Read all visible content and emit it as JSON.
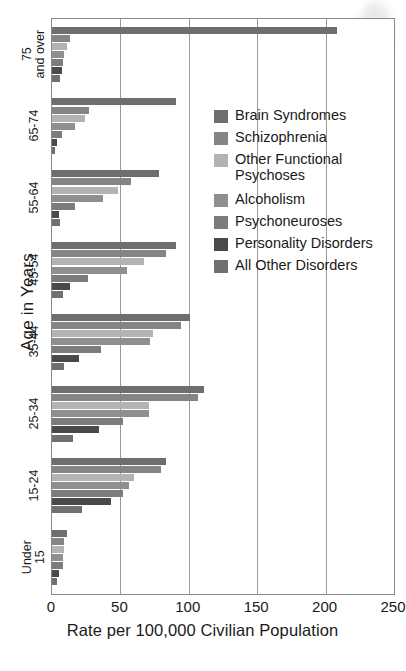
{
  "chart_data": {
    "type": "bar",
    "orientation": "horizontal",
    "title": "",
    "xlabel": "Rate per 100,000 Civilian Population",
    "ylabel": "Age in Years",
    "xlim": [
      0,
      250
    ],
    "xticks": [
      0,
      50,
      100,
      150,
      200,
      250
    ],
    "grid": "vertical",
    "legend_position": "inside-right",
    "categories": [
      "75 and over",
      "65-74",
      "55-64",
      "45-54",
      "35-44",
      "25-34",
      "15-24",
      "Under 15"
    ],
    "series": [
      {
        "name": "Brain Syndromes",
        "color": "#6e6e6e",
        "values": [
          208,
          91,
          78,
          91,
          101,
          111,
          83,
          11
        ]
      },
      {
        "name": "Schizophrenia",
        "color": "#858585",
        "values": [
          13,
          27,
          58,
          83,
          94,
          107,
          80,
          9
        ]
      },
      {
        "name": "Other Functional Psychoses",
        "color": "#b3b3b3",
        "values": [
          11,
          24,
          48,
          67,
          74,
          71,
          60,
          9
        ]
      },
      {
        "name": "Alcoholism",
        "color": "#8f8f8f",
        "values": [
          9,
          17,
          37,
          55,
          72,
          71,
          56,
          8
        ]
      },
      {
        "name": "Psychoneuroses",
        "color": "#7c7c7c",
        "values": [
          8,
          7,
          17,
          26,
          36,
          52,
          52,
          8
        ]
      },
      {
        "name": "Personality Disorders",
        "color": "#4a4a4a",
        "values": [
          7,
          4,
          5,
          13,
          20,
          34,
          43,
          5
        ]
      },
      {
        "name": "All Other Disorders",
        "color": "#707070",
        "values": [
          6,
          2,
          6,
          8,
          9,
          15,
          22,
          4
        ]
      }
    ]
  },
  "legend": {
    "items": [
      {
        "label": "Brain Syndromes",
        "color": "#6e6e6e",
        "gap_before": false
      },
      {
        "label": "Schizophrenia",
        "color": "#858585",
        "gap_before": false
      },
      {
        "label": "Other Functional\nPsychoses",
        "color": "#b3b3b3",
        "gap_before": false
      },
      {
        "label": "Alcoholism",
        "color": "#8f8f8f",
        "gap_before": true
      },
      {
        "label": "Psychoneuroses",
        "color": "#7c7c7c",
        "gap_before": false
      },
      {
        "label": "Personality Disorders",
        "color": "#4a4a4a",
        "gap_before": false
      },
      {
        "label": "All Other Disorders",
        "color": "#707070",
        "gap_before": false
      }
    ]
  },
  "axes": {
    "y_title": "Age in Years",
    "x_title": "Rate per 100,000 Civilian Population",
    "y_tick_labels": [
      "75\nand over",
      "65-74",
      "55-64",
      "45-54",
      "35-44",
      "25-34",
      "15-24",
      "Under\n15"
    ],
    "x_tick_labels": [
      "0",
      "50",
      "100",
      "150",
      "200",
      "250"
    ]
  }
}
